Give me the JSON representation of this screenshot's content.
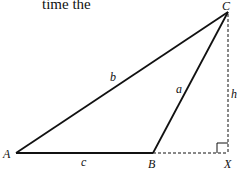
{
  "caption_fragment": "time the",
  "diagram": {
    "points": {
      "A": {
        "label": "A",
        "x": 16,
        "y": 153
      },
      "B": {
        "label": "B",
        "x": 153,
        "y": 153
      },
      "C": {
        "label": "C",
        "x": 228,
        "y": 12
      },
      "X": {
        "label": "X",
        "x": 228,
        "y": 153
      }
    },
    "sides": {
      "a": "a",
      "b": "b",
      "c": "c",
      "h": "h"
    },
    "colors": {
      "line": "#111111"
    }
  }
}
